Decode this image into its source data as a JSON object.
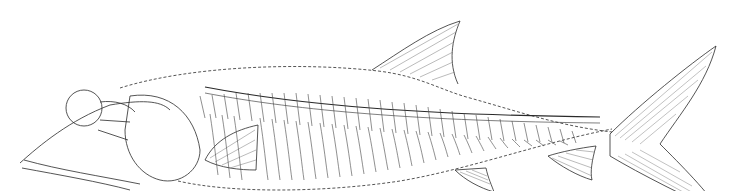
{
  "figure": {
    "background": "#ffffff",
    "ink": "#2a2a2a",
    "light_ink": "#777777",
    "outline_style": "dashed"
  }
}
